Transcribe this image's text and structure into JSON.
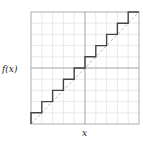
{
  "chart_data": {
    "type": "line",
    "title": "",
    "xlabel": "x",
    "ylabel": "f(x)",
    "xlim": [
      0,
      10
    ],
    "ylim": [
      0,
      10
    ],
    "grid": true,
    "grid_divisions": 10,
    "axes_center_lines": true,
    "legend": null,
    "series": [
      {
        "name": "f(x)",
        "style": "step",
        "color": "#444444",
        "x": [
          0,
          0,
          1,
          1,
          2,
          2,
          3,
          3,
          4,
          4,
          5,
          5,
          6,
          6,
          7,
          7,
          8,
          8,
          9,
          9,
          10
        ],
        "y": [
          0,
          1,
          1,
          2,
          2,
          3,
          3,
          4,
          4,
          5,
          5,
          6,
          6,
          7,
          7,
          8,
          8,
          9,
          9,
          10,
          10
        ]
      },
      {
        "name": "y = x",
        "style": "dashed",
        "color": "#bbbbbb",
        "x": [
          0,
          10
        ],
        "y": [
          0,
          10
        ]
      }
    ]
  },
  "colors": {
    "grid": "#e4e4e4",
    "center_line": "#999999",
    "frame": "#999999",
    "step": "#444444",
    "diagonal": "#bbbbbb"
  }
}
